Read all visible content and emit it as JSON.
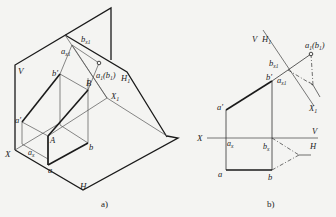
{
  "figure_a": {
    "caption": "a)",
    "labels": {
      "V": "V",
      "H": "H",
      "H1": "H",
      "H1_sub": "1",
      "X": "X",
      "X1": "X",
      "X1_sub": "1",
      "bx1": "b",
      "bx1_sub": "x1",
      "ax1": "a",
      "ax1_sub": "x1",
      "a1b1": "a",
      "a1b1_sub": "1",
      "a1b1_paren": "(b",
      "a1b1_paren_sub": "1",
      "a1b1_close": ")",
      "b_prime": "b′",
      "a_prime": "a′",
      "B": "B",
      "A": "A",
      "b": "b",
      "a": "a",
      "ax": "a",
      "ax_sub": "x"
    }
  },
  "figure_b": {
    "caption": "b)",
    "labels": {
      "V": "V",
      "H1": "H",
      "H1_sub": "1",
      "a1b1": "a",
      "a1b1_sub": "1",
      "a1b1_paren": "(b",
      "a1b1_paren_sub": "1",
      "a1b1_close": ")",
      "bx1": "b",
      "bx1_sub": "x1",
      "b_prime": "b′",
      "ax1": "a",
      "ax1_sub": "x1",
      "X1": "X",
      "X1_sub": "1",
      "a_prime": "a′",
      "X": "X",
      "V_axis": "V",
      "H_axis": "H",
      "ax": "a",
      "ax_sub": "x",
      "bx": "b",
      "bx_sub": "x",
      "a": "a",
      "b": "b"
    }
  },
  "colors": {
    "thick": "#1a1a1a",
    "thin": "#555555",
    "background": "#f4f4f2"
  }
}
